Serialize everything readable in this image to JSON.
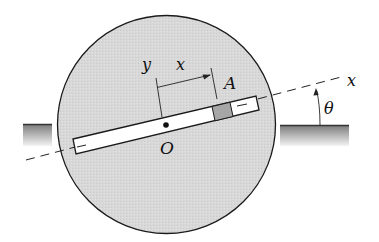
{
  "figure": {
    "type": "mechanics-diagram",
    "colors": {
      "disc_fill": "#d7d7d7",
      "outline": "#1a1a1a",
      "slot_fill": "#ffffff",
      "slider_fill": "#a6a6a6",
      "ground_top": "#7a7a7a",
      "ground_bottom": "#f2f2f2"
    }
  },
  "labels": {
    "origin": "O",
    "slider": "A",
    "y_axis": "y",
    "x_dimension": "x",
    "x_axis": "x",
    "angle": "θ"
  }
}
